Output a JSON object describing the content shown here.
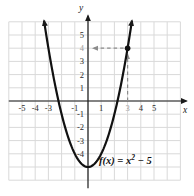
{
  "figure": {
    "background": "#ffffff",
    "colors": {
      "axis": "#1a1a1a",
      "grid": "#d9d9d9",
      "curve": "#111111",
      "dashed": "#8c8c8c",
      "tick": "#2b2b2b",
      "tick_muted": "#9c9c9c",
      "point": "#111111",
      "equation": "#111111"
    }
  },
  "chart_data": {
    "type": "line",
    "title": "",
    "equation": {
      "base": "f(x) = x",
      "sup": "2",
      "tail": " − 5"
    },
    "function": {
      "form": "quadratic",
      "a": 1,
      "b": 0,
      "c": -5
    },
    "xlabel": "x",
    "ylabel": "y",
    "xlim": [
      -6,
      7
    ],
    "ylim": [
      -6,
      6
    ],
    "grid": true,
    "curve_x_range": [
      -3.33,
      3.33
    ],
    "x_ticks": [
      {
        "label": "-5",
        "v": -5,
        "muted": false
      },
      {
        "label": "-4",
        "v": -4,
        "muted": false
      },
      {
        "label": "-3",
        "v": -3,
        "muted": false
      },
      {
        "label": "-1",
        "v": -1,
        "muted": false
      },
      {
        "label": "1",
        "v": 1,
        "muted": false
      },
      {
        "label": "3",
        "v": 3,
        "muted": true
      },
      {
        "label": "4",
        "v": 4,
        "muted": false
      },
      {
        "label": "5",
        "v": 5,
        "muted": false
      }
    ],
    "y_ticks": [
      {
        "label": "5",
        "v": 5,
        "muted": false
      },
      {
        "label": "4",
        "v": 4,
        "muted": true
      },
      {
        "label": "3",
        "v": 3,
        "muted": false
      },
      {
        "label": "2",
        "v": 2,
        "muted": false
      },
      {
        "label": "1",
        "v": 1,
        "muted": false
      },
      {
        "label": "-1",
        "v": -1,
        "muted": false
      },
      {
        "label": "-2",
        "v": -2,
        "muted": false
      },
      {
        "label": "-3",
        "v": -3,
        "muted": false
      },
      {
        "label": "-4",
        "v": -4,
        "muted": false
      }
    ],
    "point": {
      "x": 3,
      "y": 4
    },
    "dashed_guides": [
      {
        "from": [
          3,
          0
        ],
        "to": [
          3,
          4
        ],
        "direction": "up",
        "trim_from": 0,
        "trim_to": 6
      },
      {
        "from": [
          3,
          4
        ],
        "to": [
          0,
          4
        ],
        "direction": "left",
        "trim_from": 4,
        "trim_to": 5
      }
    ]
  }
}
